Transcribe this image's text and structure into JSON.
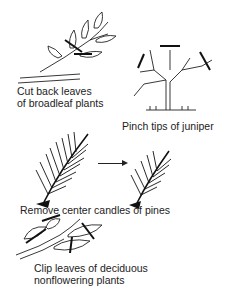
{
  "diagram": {
    "panels": [
      {
        "id": "broadleaf",
        "caption_line1": "Cut back leaves",
        "caption_line2": "of broadleaf plants"
      },
      {
        "id": "juniper",
        "caption_line1": "Pinch tips of juniper"
      },
      {
        "id": "pine",
        "caption_line1": "Remove center candles of pines"
      },
      {
        "id": "deciduous",
        "caption_line1": "Clip leaves of deciduous",
        "caption_line2": "nonflowering plants"
      }
    ],
    "icons": {
      "arrow": "right-arrow"
    },
    "colors": {
      "ink": "#222222",
      "background": "#ffffff"
    }
  }
}
